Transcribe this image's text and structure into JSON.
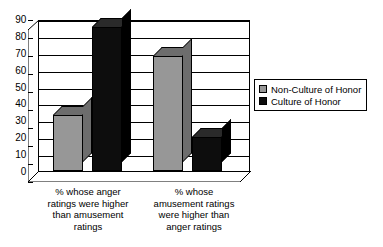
{
  "chart_data": {
    "type": "bar",
    "title": "",
    "subtitle": "",
    "xlabel": "",
    "ylabel": "",
    "ylim": [
      0,
      90
    ],
    "ytick_step": 10,
    "yticks": [
      "90",
      "80",
      "70",
      "60",
      "50",
      "40",
      "30",
      "20",
      "10",
      "0"
    ],
    "grid": true,
    "legend_position": "right",
    "style": "3d-column",
    "categories": [
      "% whose anger ratings were higher than amusement ratings",
      "% whose amusement ratings were higher than anger ratings"
    ],
    "category_lines": [
      [
        "% whose anger",
        "ratings were higher",
        "than amusement",
        "ratings"
      ],
      [
        "% whose",
        "amusement ratings",
        "were higher than",
        "anger ratings"
      ]
    ],
    "series": [
      {
        "name": "Non-Culture of Honor",
        "color": "#979797",
        "values": [
          33,
          68
        ]
      },
      {
        "name": "Culture of Honor",
        "color": "#0d0d0d",
        "values": [
          85,
          20
        ]
      }
    ]
  },
  "legend": {
    "items": [
      {
        "label": "Non-Culture of Honor",
        "swatch": "#979797"
      },
      {
        "label": "Culture of Honor",
        "swatch": "#0d0d0d"
      }
    ]
  }
}
